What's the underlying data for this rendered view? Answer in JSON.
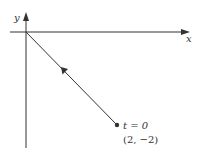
{
  "diagram": {
    "axes": {
      "x_label": "x",
      "y_label": "y"
    },
    "path": {
      "start_point": "(2, −2)",
      "start_time": "t = 0",
      "end": "origin",
      "direction": "toward origin"
    },
    "labels": {
      "time": "t = 0",
      "point": "(2, −2)"
    },
    "colors": {
      "ink": "#333333",
      "background": "#ffffff"
    }
  }
}
